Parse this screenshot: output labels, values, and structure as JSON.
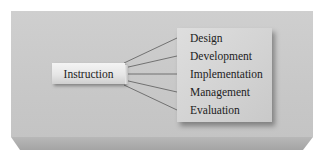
{
  "diagram": {
    "source": {
      "label": "Instruction"
    },
    "targets": [
      {
        "label": "Design"
      },
      {
        "label": "Development"
      },
      {
        "label": "Implementation"
      },
      {
        "label": "Management"
      },
      {
        "label": "Evaluation"
      }
    ],
    "colors": {
      "slab": "#c9c9c9",
      "slab_bevel": "#a9a9a9",
      "box": "#e6e6e6",
      "panel": "#d4d4d4",
      "lines": "#5a5a5a",
      "text": "#222222"
    }
  }
}
